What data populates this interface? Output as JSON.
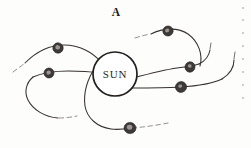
{
  "figure": {
    "label": "A",
    "center_body_label": "SUN",
    "background_color": "#fdfdfc",
    "ink_color": "#35312e",
    "sun": {
      "cx": 115,
      "cy": 74,
      "r": 22
    },
    "label_position": {
      "x": 116,
      "y": 16
    },
    "bodies": [
      {
        "name": "body-upper-right",
        "cx": 168,
        "cy": 31,
        "rx": 5.2,
        "ry": 5.0,
        "rot": -20
      },
      {
        "name": "body-upper-left",
        "cx": 58,
        "cy": 48,
        "rx": 5.2,
        "ry": 5.2,
        "rot": 10
      },
      {
        "name": "body-mid-left",
        "cx": 49,
        "cy": 73,
        "rx": 5.0,
        "ry": 5.0,
        "rot": -5
      },
      {
        "name": "body-mid-right",
        "cx": 190,
        "cy": 67,
        "rx": 5.0,
        "ry": 5.2,
        "rot": 15
      },
      {
        "name": "body-lower-right",
        "cx": 181,
        "cy": 87,
        "rx": 5.6,
        "ry": 5.4,
        "rot": -10
      },
      {
        "name": "body-bottom",
        "cx": 130,
        "cy": 128,
        "rx": 6.0,
        "ry": 5.6,
        "rot": 5
      }
    ],
    "trajectories": [
      {
        "name": "trajectory-upper-right",
        "d": "M 151 34 C 163 28 178 27 188 34 C 199 42 203 55 200 66",
        "style": "solid"
      },
      {
        "name": "trajectory-upper-right-lead",
        "d": "M 135 38 C 141 36 146 35 150 34",
        "style": "dashed"
      },
      {
        "name": "trajectory-upper-left",
        "d": "M 25 63 C 36 52 50 45 64 45 C 80 45 93 53 100 61",
        "style": "solid"
      },
      {
        "name": "trajectory-upper-left-lead",
        "d": "M 13 72 C 17 69 21 66 24 64",
        "style": "dashed"
      },
      {
        "name": "trajectory-mid-left",
        "d": "M 33 77 C 42 73 55 71 68 71 C 82 71 93 72 100 73",
        "style": "solid"
      },
      {
        "name": "trajectory-mid-left-tail",
        "d": "M 33 77 C 26 83 24 92 28 100 C 33 110 45 117 58 118",
        "style": "solid"
      },
      {
        "name": "trajectory-mid-left-tail-dash",
        "d": "M 59 118 C 66 118 72 117 77 116",
        "style": "dashed"
      },
      {
        "name": "trajectory-mid-right",
        "d": "M 133 78 C 148 74 163 70 177 68 C 185 67 193 66 199 64",
        "style": "solid"
      },
      {
        "name": "trajectory-mid-right-curl",
        "d": "M 199 64 C 205 61 209 56 210 50",
        "style": "solid"
      },
      {
        "name": "trajectory-mid-right-tick",
        "d": "M 210 49 L 211 43",
        "style": "tick"
      },
      {
        "name": "trajectory-lower-right",
        "d": "M 131 88 C 148 88 165 88 180 87 C 197 86 212 84 222 79",
        "style": "solid"
      },
      {
        "name": "trajectory-lower-right-curl",
        "d": "M 222 79 C 230 74 234 67 234 60",
        "style": "solid"
      },
      {
        "name": "trajectory-lower-right-tick",
        "d": "M 234 59 L 235 52",
        "style": "tick"
      },
      {
        "name": "trajectory-bottom",
        "d": "M 96 66 C 88 78 83 92 85 106 C 87 118 97 127 111 129 C 118 130 125 129 131 128",
        "style": "solid"
      },
      {
        "name": "trajectory-bottom-dash",
        "d": "M 132 128 C 145 127 158 125 168 123",
        "style": "dashed"
      },
      {
        "name": "trajectory-sun-spoke-left",
        "d": "M 97 67 C 102 66 107 66 112 66",
        "style": "faint"
      },
      {
        "name": "trajectory-sun-spoke-lower",
        "d": "M 117 89 C 123 88 129 87 133 86",
        "style": "faint"
      }
    ]
  },
  "margin": {
    "flecks": [
      {
        "x": 243,
        "y": 8
      },
      {
        "x": 243,
        "y": 20
      },
      {
        "x": 243,
        "y": 33
      },
      {
        "x": 243,
        "y": 46
      },
      {
        "x": 243,
        "y": 59
      },
      {
        "x": 243,
        "y": 72
      },
      {
        "x": 243,
        "y": 85
      },
      {
        "x": 243,
        "y": 98
      }
    ]
  }
}
